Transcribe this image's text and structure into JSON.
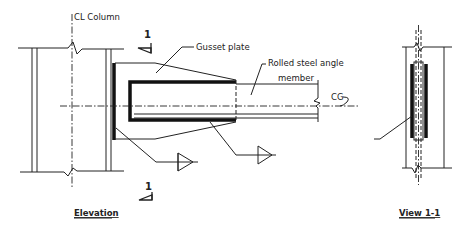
{
  "labels": {
    "cl_column": "CL Column",
    "gusset_plate": "Gusset plate",
    "rolled_angle_line1": "Rolled steel angle",
    "rolled_angle_line2": "member",
    "cg": "CG",
    "section_mark_top": "1",
    "section_mark_bottom": "1"
  },
  "views": {
    "elevation_title": "Elevation",
    "section_title": "View 1-1"
  },
  "colors": {
    "line": "#222222",
    "background": "#ffffff"
  }
}
